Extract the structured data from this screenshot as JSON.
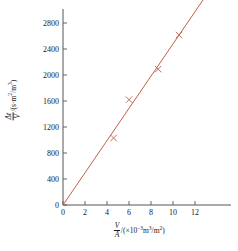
{
  "chart_data": {
    "type": "scatter",
    "title": "",
    "xlabel": "V/A /(×10⁻³ m³/m²)",
    "ylabel": "Δt/V /(s·m²/m³)",
    "xlabel_parts": {
      "num": "V",
      "den": "A",
      "unit_prefix": "/(×10",
      "unit_exp": "−3",
      "unit_mid": "m",
      "unit_exp2": "3",
      "unit_div": "/m",
      "unit_exp3": "2",
      "unit_suffix": ")"
    },
    "ylabel_parts": {
      "num": "Δt",
      "den": "V",
      "unit_prefix": "/(s·m",
      "unit_exp": "2",
      "unit_div": "/m",
      "unit_exp2": "3",
      "unit_suffix": ")"
    },
    "xlim": [
      0,
      13.6
    ],
    "ylim": [
      0,
      3000
    ],
    "xticks": [
      0,
      2,
      4,
      6,
      8,
      10,
      12
    ],
    "xtick_labels": [
      "0",
      "2",
      "4",
      "6",
      "8",
      "10",
      "12"
    ],
    "yticks": [
      0,
      400,
      800,
      1200,
      1600,
      2000,
      2400,
      2800
    ],
    "ytick_labels": [
      "0",
      "400",
      "800",
      "1200",
      "1600",
      "2000",
      "2400",
      "2800"
    ],
    "grid": false,
    "legend": "none",
    "marker": "x",
    "marker_color": "#c0604a",
    "line_color": "#c0604a",
    "axis_color": "#555555",
    "points": [
      {
        "x": 4.6,
        "y": 1030
      },
      {
        "x": 6.0,
        "y": 1620
      },
      {
        "x": 8.65,
        "y": 2090
      },
      {
        "x": 10.55,
        "y": 2615
      }
    ],
    "fit_line": {
      "x_start": 0,
      "y_start": 0,
      "x_end": 12.75,
      "y_end": 3160,
      "slope": 248,
      "intercept": 0
    }
  }
}
